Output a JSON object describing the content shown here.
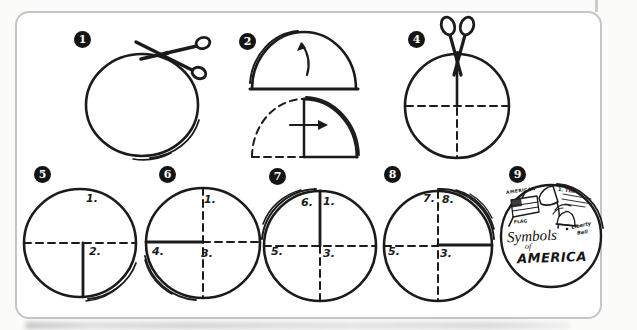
{
  "palette": {
    "ink": "#1b1b1b",
    "card_border": "#c5c5c5",
    "badge_bg": "#141414",
    "badge_fg": "#ffffff",
    "paper": "#ffffff"
  },
  "steps": [
    {
      "num": "1",
      "icon": "scissors-icon"
    },
    {
      "num": "2",
      "icon": "fold-arrow-icon"
    },
    {
      "num": "4",
      "icon": "scissors-icon"
    },
    {
      "num": "5",
      "page_labels": [
        "1.",
        "2."
      ]
    },
    {
      "num": "6",
      "page_labels": [
        "1.",
        "4.",
        "3."
      ]
    },
    {
      "num": "7",
      "page_labels": [
        "6.",
        "1.",
        "5.",
        "3."
      ]
    },
    {
      "num": "8",
      "page_labels": [
        "7.",
        "8.",
        "5.",
        "3."
      ]
    },
    {
      "num": "9",
      "cover": {
        "flag_top": "AMERICAN",
        "flag_bottom": "FLAG",
        "flap_line": "1. The",
        "bell_top": "Liberty",
        "bell_bottom": "Bell",
        "title": "Symbols",
        "title_of": "of",
        "title_country": "AMERICA"
      }
    }
  ]
}
